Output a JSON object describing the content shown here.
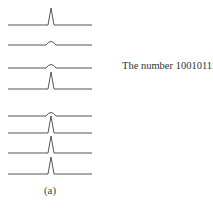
{
  "figure": {
    "label": "The number 10010111",
    "caption": "(a)",
    "bits": [
      "1",
      "0",
      "0",
      "1",
      "0",
      "1",
      "1",
      "1"
    ],
    "line_y": [
      25,
      45,
      68,
      89,
      116,
      133,
      153,
      174
    ],
    "line_x": [
      8,
      92
    ],
    "pulse_x": 51,
    "stroke_color": "#555555"
  }
}
